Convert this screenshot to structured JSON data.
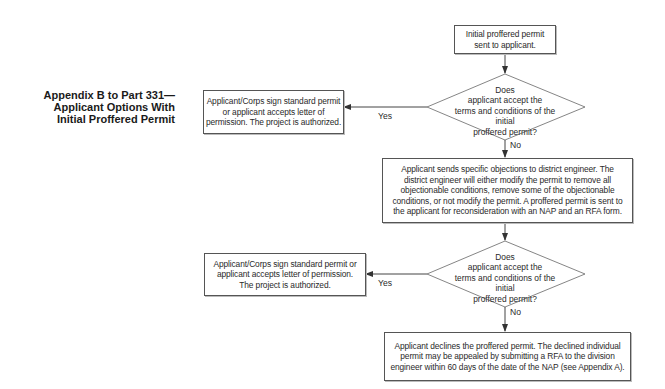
{
  "title": {
    "lines": [
      "Appendix B to Part 331—",
      "Applicant Options With",
      "Initial Proffered Permit"
    ]
  },
  "nodes": {
    "start": {
      "type": "process",
      "text": "Initial proffered permit sent to applicant."
    },
    "decision1": {
      "type": "decision",
      "lines": [
        "Does",
        "applicant accept the",
        "terms and conditions of the initial",
        "proffered permit?"
      ]
    },
    "authorized1": {
      "type": "process",
      "lines": [
        "Applicant/Corps sign standard permit",
        "or applicant accepts letter of",
        "permission. The project is authorized."
      ]
    },
    "objections": {
      "type": "process",
      "lines": [
        "Applicant sends specific objections to district engineer. The",
        "district engineer will either modify the permit to remove all",
        "objectionable conditions, remove some of the objectionable",
        "conditions, or not modify the permit. A proffered permit is sent to",
        "the applicant for reconsideration with an NAP and an RFA form."
      ]
    },
    "decision2": {
      "type": "decision",
      "lines": [
        "Does",
        "applicant accept the",
        "terms and conditions of the initial",
        "proffered permit?"
      ]
    },
    "authorized2": {
      "type": "process",
      "lines": [
        "Applicant/Corps sign standard permit or",
        "applicant accepts letter of permission.",
        "The project is authorized."
      ]
    },
    "declines": {
      "type": "process",
      "lines": [
        "Applicant declines the proffered permit. The declined individual",
        "permit may be appealed by submitting a RFA to the division",
        "engineer within 60 days of the date of the NAP (see Appendix A)."
      ]
    }
  },
  "edges": [
    {
      "from": "start",
      "to": "decision1",
      "label": ""
    },
    {
      "from": "decision1",
      "to": "authorized1",
      "label": "Yes"
    },
    {
      "from": "decision1",
      "to": "objections",
      "label": "No"
    },
    {
      "from": "objections",
      "to": "decision2",
      "label": ""
    },
    {
      "from": "decision2",
      "to": "authorized2",
      "label": "Yes"
    },
    {
      "from": "decision2",
      "to": "declines",
      "label": "No"
    }
  ],
  "colors": {
    "line": "#444444",
    "box_border": "#555555",
    "text": "#2a2a2a"
  }
}
